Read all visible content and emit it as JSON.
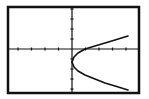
{
  "screen": {
    "type": "graphing-calculator-screen",
    "background": "#ffffff",
    "ink": "#111111"
  },
  "chart_data": {
    "type": "line",
    "title": "",
    "xlabel": "",
    "ylabel": "",
    "grid": false,
    "axes": true,
    "x_ticks_left": 4,
    "x_ticks_right": 4,
    "y_ticks_above": 4,
    "y_ticks_below": 4,
    "series": [
      {
        "name": "upper-branch",
        "points_px": [
          [
            72,
            62
          ],
          [
            74,
            57
          ],
          [
            78,
            53
          ],
          [
            85,
            49
          ],
          [
            95,
            46
          ],
          [
            105,
            43
          ],
          [
            115,
            40
          ],
          [
            128,
            36
          ]
        ]
      },
      {
        "name": "lower-branch",
        "points_px": [
          [
            72,
            62
          ],
          [
            74,
            67
          ],
          [
            78,
            71
          ],
          [
            85,
            75
          ],
          [
            95,
            79
          ],
          [
            105,
            83
          ],
          [
            115,
            86
          ],
          [
            128,
            90
          ]
        ]
      }
    ]
  }
}
